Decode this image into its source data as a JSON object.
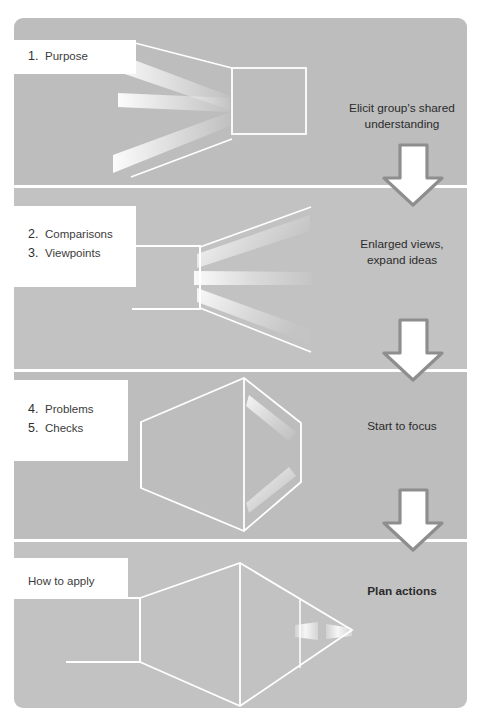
{
  "diagram": {
    "colors": {
      "panel_background": "#bdbdbd",
      "panel_background_alt": "#c2c2c2",
      "page_background": "#ffffff",
      "line": "#ffffff",
      "beam": "#f2f2f2",
      "arrow_fill": "#ffffff",
      "arrow_stroke": "#8e8e8e",
      "text": "#2b2b2b",
      "label_background": "#ffffff"
    },
    "panels": [
      {
        "id": "panel-purpose",
        "shape": "square-with-diverging-beams-left",
        "label": {
          "type": "numbered",
          "items": [
            {
              "number": "1.",
              "text": "Purpose"
            }
          ]
        },
        "caption": "Elicit group's shared\nunderstanding",
        "caption_bold": false,
        "arrow_below": true
      },
      {
        "id": "panel-comparisons-viewpoints",
        "shape": "rectangle-with-diverging-beams-right",
        "label": {
          "type": "numbered",
          "items": [
            {
              "number": "2.",
              "text": "Comparisons"
            },
            {
              "number": "3.",
              "text": "Viewpoints"
            }
          ]
        },
        "caption": "Enlarged views,\nexpand ideas",
        "caption_bold": false,
        "arrow_below": true
      },
      {
        "id": "panel-problems-checks",
        "shape": "hexagonal-prism-converging",
        "label": {
          "type": "numbered",
          "items": [
            {
              "number": "4.",
              "text": "Problems"
            },
            {
              "number": "5.",
              "text": "Checks"
            }
          ]
        },
        "caption": "Start to focus",
        "caption_bold": false,
        "arrow_below": true
      },
      {
        "id": "panel-how-to-apply",
        "shape": "lens-converging-to-point",
        "label": {
          "type": "plain",
          "items": [
            {
              "number": "",
              "text": "How to apply"
            }
          ]
        },
        "caption": "Plan actions",
        "caption_bold": true,
        "arrow_below": false
      }
    ],
    "arrows": [
      {
        "id": "arrow-1",
        "direction": "down"
      },
      {
        "id": "arrow-2",
        "direction": "down"
      },
      {
        "id": "arrow-3",
        "direction": "down"
      }
    ]
  }
}
